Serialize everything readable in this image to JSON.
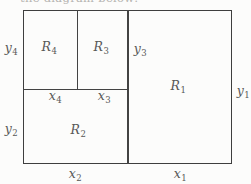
{
  "figure": {
    "top_clipped_text": "the diagram below:",
    "colors": {
      "line": "#3e3e3e",
      "label": "#585858",
      "background": "#fcfcfb"
    },
    "labels": {
      "r1": {
        "base": "R",
        "sub": "1"
      },
      "r2": {
        "base": "R",
        "sub": "2"
      },
      "r3": {
        "base": "R",
        "sub": "3"
      },
      "r4": {
        "base": "R",
        "sub": "4"
      },
      "x1": {
        "base": "x",
        "sub": "1"
      },
      "x2": {
        "base": "x",
        "sub": "2"
      },
      "x3": {
        "base": "x",
        "sub": "3"
      },
      "x4": {
        "base": "x",
        "sub": "4"
      },
      "y1": {
        "base": "y",
        "sub": "1"
      },
      "y2": {
        "base": "y",
        "sub": "2"
      },
      "y3": {
        "base": "y",
        "sub": "3"
      },
      "y4": {
        "base": "y",
        "sub": "4"
      }
    }
  }
}
